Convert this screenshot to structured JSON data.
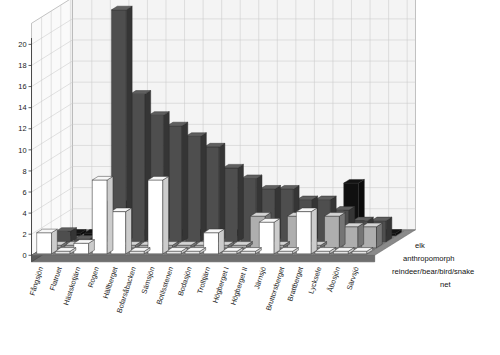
{
  "chart_data": {
    "type": "bar",
    "title": "",
    "subtitle": "",
    "xlabel": "",
    "ylabel": "",
    "ylim": [
      0,
      20
    ],
    "yticks": [
      0,
      2,
      4,
      6,
      8,
      10,
      12,
      14,
      16,
      18,
      20
    ],
    "grid": true,
    "projection": "3d",
    "legend_position": "right",
    "categories": [
      "Fångsjön",
      "Flatruet",
      "Hästskotjärn",
      "Rogen",
      "Hällberget",
      "Bofarsåbacken",
      "Sämsjön",
      "Botilsstenen",
      "Bodasjön",
      "Trolltjärn",
      "Högberget I",
      "Högberget II",
      "Järnsjö",
      "Bruttorsberget",
      "Brattberget",
      "Lycksele",
      "Åbosjön",
      "Särvsjö"
    ],
    "series": [
      {
        "name": "elk",
        "color": "#ffffff",
        "values": [
          2,
          0,
          1,
          7,
          4,
          0,
          7,
          0,
          0,
          2,
          0,
          0,
          3,
          0,
          4,
          0,
          0,
          0
        ]
      },
      {
        "name": "anthropomorph",
        "color": "#bdbdbd",
        "values": [
          0,
          0,
          0,
          0,
          0,
          0,
          0,
          0,
          0,
          0,
          0,
          3,
          0,
          3,
          0,
          3,
          2,
          2
        ]
      },
      {
        "name": "reindeer/bear/bird/snake",
        "color": "#555555",
        "values": [
          1,
          0,
          0,
          22,
          14,
          12,
          11,
          10,
          9,
          7,
          6,
          5,
          5,
          4,
          4,
          3,
          2,
          2
        ]
      },
      {
        "name": "net",
        "color": "#111111",
        "values": [
          0,
          0,
          3,
          3,
          0,
          0,
          0,
          0,
          0,
          0,
          0,
          0,
          0,
          0,
          0,
          5,
          0,
          0
        ]
      }
    ]
  },
  "legend": {
    "entries": [
      {
        "label": "elk"
      },
      {
        "label": "anthropomorph"
      },
      {
        "label": "reindeer/bear/bird/snake"
      },
      {
        "label": "net"
      }
    ]
  },
  "axis": {
    "y_max_label": "20",
    "y_min_label": "0"
  }
}
